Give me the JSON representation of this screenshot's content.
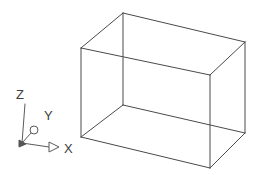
{
  "viewport": {
    "background_color": "#ffffff",
    "line_color": "#4a4a4a",
    "axis_color": "#5a5a5a",
    "label_color": "#3d3d3d",
    "width": 264,
    "height": 175
  },
  "ucs_icon": {
    "name": "ucs-coordinate-axes",
    "origin": {
      "x": 22,
      "y": 143
    },
    "axes": [
      {
        "id": "z",
        "label": "Z",
        "label_x": 16,
        "label_y": 99,
        "line": {
          "x1": 22,
          "y1": 143,
          "x2": 25,
          "y2": 104
        },
        "marker": "none"
      },
      {
        "id": "y",
        "label": "Y",
        "label_x": 44,
        "label_y": 120,
        "line": {
          "x1": 22,
          "y1": 143,
          "x2": 33,
          "y2": 131
        },
        "marker": "circle"
      },
      {
        "id": "x",
        "label": "X",
        "label_x": 64,
        "label_y": 153,
        "line": {
          "x1": 22,
          "y1": 143,
          "x2": 49,
          "y2": 147
        },
        "marker": "arrow"
      }
    ]
  },
  "box": {
    "name": "wireframe-box",
    "shape": "rectangular-prism",
    "vertices": {
      "front_top_left": {
        "x": 81,
        "y": 48
      },
      "front_top_right": {
        "x": 210,
        "y": 75
      },
      "front_bottom_left": {
        "x": 81,
        "y": 137
      },
      "front_bottom_right": {
        "x": 210,
        "y": 168
      },
      "back_top_left": {
        "x": 123,
        "y": 13
      },
      "back_top_right": {
        "x": 245,
        "y": 42
      },
      "back_bottom_left": {
        "x": 123,
        "y": 105
      },
      "back_bottom_right": {
        "x": 245,
        "y": 133
      }
    },
    "edges": [
      {
        "id": "top-front",
        "from": "front_top_left",
        "to": "front_top_right"
      },
      {
        "id": "top-back",
        "from": "back_top_left",
        "to": "back_top_right"
      },
      {
        "id": "top-left",
        "from": "front_top_left",
        "to": "back_top_left"
      },
      {
        "id": "top-right",
        "from": "front_top_right",
        "to": "back_top_right"
      },
      {
        "id": "bottom-front",
        "from": "front_bottom_left",
        "to": "front_bottom_right"
      },
      {
        "id": "bottom-back",
        "from": "back_bottom_left",
        "to": "back_bottom_right"
      },
      {
        "id": "bottom-left",
        "from": "front_bottom_left",
        "to": "back_bottom_left"
      },
      {
        "id": "bottom-right",
        "from": "front_bottom_right",
        "to": "back_bottom_right"
      },
      {
        "id": "vertical-front-left",
        "from": "front_top_left",
        "to": "front_bottom_left"
      },
      {
        "id": "vertical-front-right",
        "from": "front_top_right",
        "to": "front_bottom_right"
      },
      {
        "id": "vertical-back-left",
        "from": "back_top_left",
        "to": "back_bottom_left"
      },
      {
        "id": "vertical-back-right",
        "from": "back_top_right",
        "to": "back_bottom_right"
      }
    ]
  }
}
